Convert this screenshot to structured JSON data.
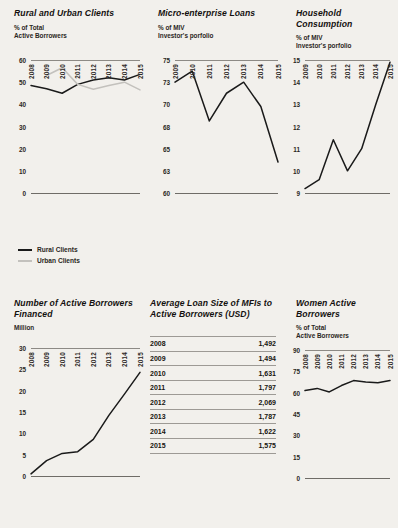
{
  "background": "#f2f0ec",
  "accent_dark": "#1a1a1a",
  "accent_light": "#c3c1bd",
  "panels": {
    "rural_urban": {
      "title": "Rural and Urban Clients",
      "subtitle_line1": "% of Total",
      "subtitle_line2": "Active Borrowers",
      "legend": [
        {
          "label": "Rural Clients",
          "color": "#1a1a1a"
        },
        {
          "label": "Urban Clients",
          "color": "#c3c1bd"
        }
      ]
    },
    "micro_loans": {
      "title": "Micro-enterprise Loans",
      "subtitle_line1": "% of MIV",
      "subtitle_line2": "Investor's porfolio"
    },
    "household": {
      "title": "Household Consumption",
      "subtitle_line1": "% of MIV",
      "subtitle_line2": "Investor's porfolio"
    },
    "borrowers_financed": {
      "title_line1": "Number of Active Borrowers",
      "title_line2": "Financed",
      "subtitle_line1": "Million"
    },
    "loan_size": {
      "title_line1": "Average Loan Size of MFIs to",
      "title_line2": "Active Borrowers (USD)"
    },
    "women": {
      "title": "Women Active Borrowers",
      "subtitle_line1": "% of Total",
      "subtitle_line2": "Active Borrowers"
    }
  },
  "chart_data": [
    {
      "id": "rural_urban",
      "type": "line",
      "title": "Rural and Urban Clients",
      "ylabel": "% of Total Active Borrowers",
      "xlabel": "",
      "categories": [
        "2008",
        "2009",
        "2010",
        "2011",
        "2012",
        "2013",
        "2014",
        "2015"
      ],
      "yticks": [
        0,
        10,
        20,
        30,
        40,
        50,
        60
      ],
      "ylim": [
        0,
        60
      ],
      "grid": false,
      "legend_position": "below",
      "series": [
        {
          "name": "Rural Clients",
          "color": "#1a1a1a",
          "values": [
            48.5,
            47.0,
            45.0,
            49.0,
            51.0,
            52.0,
            51.0,
            53.5
          ]
        },
        {
          "name": "Urban Clients",
          "color": "#c3c1bd",
          "values": [
            null,
            53.0,
            56.5,
            49.0,
            46.8,
            48.5,
            50.0,
            46.5
          ]
        }
      ]
    },
    {
      "id": "micro_loans",
      "type": "line",
      "title": "Micro-enterprise Loans",
      "ylabel": "% of MIV Investor's porfolio",
      "xlabel": "",
      "categories": [
        "2009",
        "2010",
        "2011",
        "2012",
        "2013",
        "2014",
        "2015"
      ],
      "yticks": [
        60,
        63,
        65,
        68,
        70,
        73,
        75
      ],
      "ylim": [
        60,
        75
      ],
      "axis_scale": "non-linear-even-spacing",
      "grid": false,
      "values": [
        73.0,
        74.0,
        68.5,
        71.5,
        73.0,
        69.8,
        63.8
      ]
    },
    {
      "id": "household",
      "type": "line",
      "title": "Household Consumption",
      "ylabel": "% of MIV Investor's porfolio",
      "xlabel": "",
      "categories": [
        "2009",
        "2010",
        "2011",
        "2012",
        "2013",
        "2014",
        "2015"
      ],
      "yticks": [
        9,
        10,
        11,
        12,
        13,
        14,
        15
      ],
      "ylim": [
        9,
        15
      ],
      "grid": false,
      "values": [
        9.2,
        9.6,
        11.4,
        10.0,
        11.0,
        13.0,
        14.9
      ]
    },
    {
      "id": "borrowers_financed",
      "type": "line",
      "title": "Number of Active Borrowers Financed",
      "ylabel": "Million",
      "xlabel": "",
      "categories": [
        "2008",
        "2009",
        "2010",
        "2011",
        "2012",
        "2013",
        "2014",
        "2015"
      ],
      "yticks": [
        0,
        5,
        10,
        15,
        20,
        25,
        30
      ],
      "ylim": [
        0,
        30
      ],
      "grid": false,
      "values": [
        0.5,
        3.6,
        5.3,
        5.7,
        8.6,
        14.2,
        19.2,
        24.3
      ]
    },
    {
      "id": "loan_size",
      "type": "table",
      "title": "Average Loan Size of MFIs to Active Borrowers (USD)",
      "categories": [
        "2008",
        "2009",
        "2010",
        "2011",
        "2012",
        "2013",
        "2014",
        "2015"
      ],
      "values": [
        1492,
        1494,
        1631,
        1797,
        2069,
        1787,
        1622,
        1575
      ],
      "rows": [
        {
          "year": "2008",
          "value": "1,492"
        },
        {
          "year": "2009",
          "value": "1,494"
        },
        {
          "year": "2010",
          "value": "1,631"
        },
        {
          "year": "2011",
          "value": "1,797"
        },
        {
          "year": "2012",
          "value": "2,069"
        },
        {
          "year": "2013",
          "value": "1,787"
        },
        {
          "year": "2014",
          "value": "1,622"
        },
        {
          "year": "2015",
          "value": "1,575"
        }
      ]
    },
    {
      "id": "women",
      "type": "line",
      "title": "Women Active Borrowers",
      "ylabel": "% of Total Active Borrowers",
      "xlabel": "",
      "categories": [
        "2008",
        "2009",
        "2010",
        "2011",
        "2012",
        "2013",
        "2014",
        "2015"
      ],
      "yticks": [
        0,
        15,
        30,
        45,
        60,
        75,
        90
      ],
      "ylim": [
        0,
        90
      ],
      "grid": false,
      "values": [
        61.5,
        63.0,
        60.5,
        65.0,
        68.5,
        67.5,
        67.0,
        68.5
      ]
    }
  ]
}
